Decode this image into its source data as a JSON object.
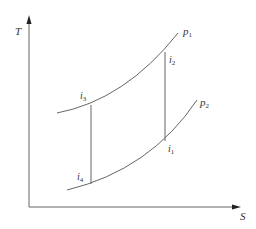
{
  "diagram": {
    "type": "T-S diagram",
    "axes": {
      "y_label": "T",
      "x_label": "S"
    },
    "curves": [
      {
        "name": "p",
        "subscript": "1",
        "label": "p1"
      },
      {
        "name": "p",
        "subscript": "2",
        "label": "p2"
      }
    ],
    "points": [
      {
        "name": "i",
        "subscript": "1",
        "label": "i1"
      },
      {
        "name": "i",
        "subscript": "2",
        "label": "i2"
      },
      {
        "name": "i",
        "subscript": "3",
        "label": "i3"
      },
      {
        "name": "i",
        "subscript": "4",
        "label": "i4"
      }
    ],
    "colors": {
      "line": "#666666",
      "text": "#333333",
      "background": "#ffffff"
    }
  }
}
